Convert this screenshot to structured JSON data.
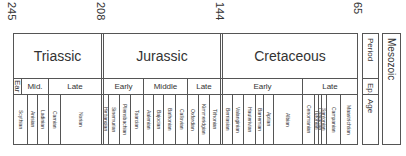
{
  "boundaries": [
    {
      "label": "245",
      "x": 6
    },
    {
      "label": "208",
      "x": 95
    },
    {
      "label": "144",
      "x": 214
    },
    {
      "label": "65",
      "x": 352
    }
  ],
  "periods": [
    {
      "label": "Triassic",
      "x": 13,
      "w": 88
    },
    {
      "label": "Jurassic",
      "x": 101,
      "w": 119
    },
    {
      "label": "Cretaceous",
      "x": 220,
      "w": 137
    }
  ],
  "epochs": [
    {
      "label": "Ear",
      "x": 13,
      "w": 8,
      "vertical": true
    },
    {
      "label": "Mid.",
      "x": 21,
      "w": 27
    },
    {
      "label": "Late",
      "x": 48,
      "w": 53
    },
    {
      "label": "Early",
      "x": 101,
      "w": 42
    },
    {
      "label": "Middle",
      "x": 143,
      "w": 44
    },
    {
      "label": "Late",
      "x": 187,
      "w": 33
    },
    {
      "label": "Early",
      "x": 220,
      "w": 82
    },
    {
      "label": "Late",
      "x": 302,
      "w": 55
    }
  ],
  "ages": [
    {
      "label": "Scythian",
      "x": 13,
      "w": 14
    },
    {
      "label": "Anisian",
      "x": 27,
      "w": 10
    },
    {
      "label": "Ladinian",
      "x": 37,
      "w": 11
    },
    {
      "label": "Carnian",
      "x": 48,
      "w": 12
    },
    {
      "label": "Norian",
      "x": 60,
      "w": 41
    },
    {
      "label": "Hettangian",
      "x": 101,
      "w": 7
    },
    {
      "label": "Sinemurian",
      "x": 108,
      "w": 11
    },
    {
      "label": "Pliensbachian",
      "x": 119,
      "w": 11
    },
    {
      "label": "Toarcian",
      "x": 130,
      "w": 13
    },
    {
      "label": "Aalenian",
      "x": 143,
      "w": 10
    },
    {
      "label": "Bajocian",
      "x": 153,
      "w": 10
    },
    {
      "label": "Bathonian",
      "x": 163,
      "w": 12
    },
    {
      "label": "Callovian",
      "x": 175,
      "w": 12
    },
    {
      "label": "Oxfordian",
      "x": 187,
      "w": 11
    },
    {
      "label": "Kimmeridgian",
      "x": 198,
      "w": 11
    },
    {
      "label": "Tithonian",
      "x": 209,
      "w": 11
    },
    {
      "label": "Berriasian",
      "x": 220,
      "w": 12
    },
    {
      "label": "Valanginian",
      "x": 232,
      "w": 11
    },
    {
      "label": "Hauterivian",
      "x": 243,
      "w": 12
    },
    {
      "label": "Barremian",
      "x": 255,
      "w": 8
    },
    {
      "label": "Aptian",
      "x": 263,
      "w": 10
    },
    {
      "label": "Albian",
      "x": 273,
      "w": 29
    },
    {
      "label": "Cenomanian",
      "x": 302,
      "w": 12
    },
    {
      "label": "Turonian",
      "x": 314,
      "w": 4
    },
    {
      "label": "Coniacian",
      "x": 318,
      "w": 3
    },
    {
      "label": "Santonian",
      "x": 321,
      "w": 5
    },
    {
      "label": "Campanian",
      "x": 326,
      "w": 14
    },
    {
      "label": "Maastrichtian",
      "x": 340,
      "w": 17
    }
  ],
  "legend": {
    "period": "Period",
    "epoch": "Ep.",
    "age": "Age",
    "era": "Mesozoic"
  }
}
